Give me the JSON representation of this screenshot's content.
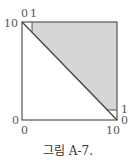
{
  "figure": {
    "caption": "그림 A-7.",
    "labels": {
      "top_left_y": "10",
      "top_x0": "0",
      "top_x1": "1",
      "origin_y": "0",
      "origin_x": "0",
      "bottom_right_x": "10",
      "right_y1": "1",
      "right_y0": "0"
    },
    "colors": {
      "shade": "#d6d6d6",
      "line": "#555555"
    }
  }
}
